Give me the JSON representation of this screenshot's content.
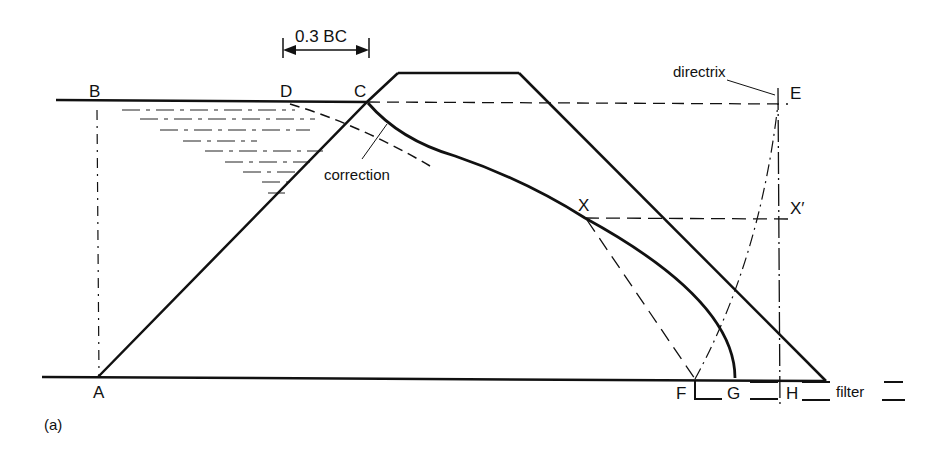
{
  "figure": {
    "panel_label": "(a)",
    "labels": {
      "A": "A",
      "B": "B",
      "C": "C",
      "D": "D",
      "E": "E",
      "F": "F",
      "G": "G",
      "H": "H",
      "X": "X",
      "X_prime": "X′"
    },
    "annotations": {
      "dimension": "0.3 BC",
      "correction": "correction",
      "directrix": "directrix",
      "filter": "filter"
    },
    "colors": {
      "line": "#111111",
      "background": "#ffffff"
    }
  }
}
